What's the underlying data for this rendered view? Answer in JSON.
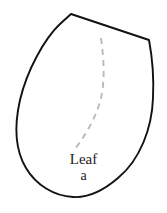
{
  "figure": {
    "title": "Leaf a",
    "caption_name": "Leaf",
    "caption_index": "a",
    "background_color": "#fefefe",
    "outline_color": "#111111",
    "outline_fill": "#ffffff",
    "midrib_color": "#b9b9b9",
    "caption_color": "#1b1b1b"
  },
  "shape": {
    "name": "leaf-outline",
    "description": "ovate teardrop leaf with pointed apex at top",
    "apex_point": "71,14",
    "shoulder_point": "149,40",
    "widest_left_x": "16",
    "lowest_point_y": "198",
    "path": "M71,14 L149,40 C152,56 154,78 153,98 C152,128 140,160 118,178 C104,190 88,198 73,197 C54,196 36,185 26,168 C14,148 15,122 20,100 C27,70 45,38 60,24 Z"
  },
  "midrib": {
    "name": "leaf-midrib",
    "description": "dashed central vein curve",
    "dash_pattern": "6 5",
    "start_point": "101,38",
    "end_point": "75,149",
    "path": "M101,38 C104,60 105,80 101,98 C96,118 86,134 75,149"
  }
}
